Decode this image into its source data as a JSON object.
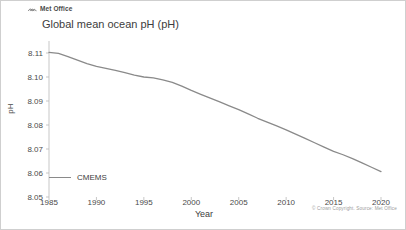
{
  "brand": {
    "name": "Met Office",
    "logo_icon": "met-office-logo-icon"
  },
  "chart_title": "Global mean ocean pH (pH)",
  "copyright": "© Crown Copyright. Source: Met Office",
  "legend": {
    "position": "bottom-left",
    "entries": [
      {
        "label": "CMEMS",
        "color": "#8a8a8a"
      }
    ]
  },
  "axes": {
    "y_ticks": [
      "8.11",
      "8.10",
      "8.09",
      "8.08",
      "8.07",
      "8.06",
      "8.05"
    ],
    "x_ticks": [
      "1985",
      "1990",
      "1995",
      "2000",
      "2005",
      "2010",
      "2015",
      "2020"
    ],
    "ylabel": "pH",
    "xlabel": "Year"
  },
  "chart_data": {
    "type": "line",
    "title": "Global mean ocean pH (pH)",
    "xlabel": "Year",
    "ylabel": "pH",
    "xlim": [
      1985,
      2020
    ],
    "ylim": [
      8.05,
      8.115
    ],
    "grid": false,
    "legend_position": "bottom-left",
    "x": [
      1985,
      1986,
      1987,
      1988,
      1989,
      1990,
      1991,
      1992,
      1993,
      1994,
      1995,
      1996,
      1997,
      1998,
      1999,
      2000,
      2001,
      2002,
      2003,
      2004,
      2005,
      2006,
      2007,
      2008,
      2009,
      2010,
      2011,
      2012,
      2013,
      2014,
      2015,
      2016,
      2017,
      2018,
      2019,
      2020
    ],
    "series": [
      {
        "name": "CMEMS",
        "color": "#8a8a8a",
        "values": [
          8.1103,
          8.1098,
          8.1085,
          8.107,
          8.1056,
          8.1044,
          8.1036,
          8.1028,
          8.1018,
          8.1008,
          8.1,
          8.0996,
          8.0988,
          8.0978,
          8.0962,
          8.0944,
          8.0928,
          8.0912,
          8.0896,
          8.088,
          8.0864,
          8.0846,
          8.0828,
          8.0812,
          8.0796,
          8.078,
          8.0762,
          8.0744,
          8.0726,
          8.0708,
          8.069,
          8.0676,
          8.066,
          8.0642,
          8.0624,
          8.0606
        ]
      }
    ]
  }
}
